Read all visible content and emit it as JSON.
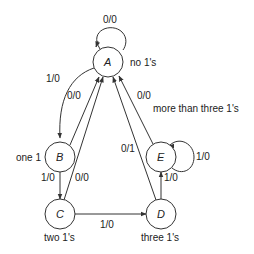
{
  "diagram": {
    "type": "state-machine",
    "states": [
      {
        "id": "A",
        "label": "A",
        "description": "no 1's"
      },
      {
        "id": "B",
        "label": "B",
        "description": "one 1"
      },
      {
        "id": "C",
        "label": "C",
        "description": "two 1's"
      },
      {
        "id": "D",
        "label": "D",
        "description": "three 1's"
      },
      {
        "id": "E",
        "label": "E",
        "description": "more than three 1's"
      }
    ],
    "transitions": [
      {
        "from": "A",
        "to": "A",
        "label": "0/0"
      },
      {
        "from": "A",
        "to": "B",
        "label": "1/0"
      },
      {
        "from": "B",
        "to": "A",
        "label": "0/0"
      },
      {
        "from": "B",
        "to": "C",
        "label": "1/0"
      },
      {
        "from": "C",
        "to": "A",
        "label": "0/0"
      },
      {
        "from": "C",
        "to": "D",
        "label": "1/0"
      },
      {
        "from": "D",
        "to": "A",
        "label": "0/1"
      },
      {
        "from": "D",
        "to": "E",
        "label": "1/0"
      },
      {
        "from": "E",
        "to": "A",
        "label": "0/0"
      },
      {
        "from": "E",
        "to": "E",
        "label": "1/0"
      }
    ]
  }
}
